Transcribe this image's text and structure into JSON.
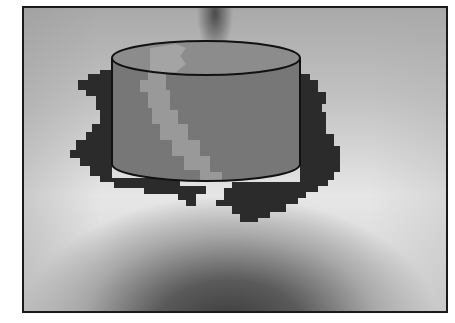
{
  "figure": {
    "colors": {
      "frame_border": "#1a1a1a",
      "background_light": "#e6e6e6",
      "background_dark": "#3a3a3a",
      "blob": "#2b2b2b",
      "cylinder_body": "#777777",
      "cylinder_band": "#9a9a9a",
      "cylinder_outline": "#111111"
    }
  }
}
